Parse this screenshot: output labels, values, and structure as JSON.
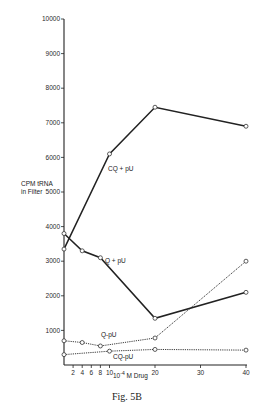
{
  "chart_data": {
    "type": "line",
    "title": "",
    "caption": "Fig. 5B",
    "xlabel": "10⁻⁴M Drug",
    "xlabel_base": "10",
    "xlabel_exp": "-4",
    "xlabel_unit": "M Drug",
    "ylabel": "CPM tRNA in Filter",
    "ylabel_line1": "CPM tRNA",
    "ylabel_line2": "in Filter",
    "xlim": [
      0,
      40
    ],
    "ylim": [
      0,
      10000
    ],
    "x_ticks": [
      2,
      4,
      6,
      8,
      10,
      20,
      30,
      40
    ],
    "y_ticks": [
      1000,
      2000,
      3000,
      4000,
      5000,
      6000,
      7000,
      8000,
      9000,
      10000
    ],
    "grid": false,
    "series": [
      {
        "name": "CQ + pU",
        "style": "solid",
        "x": [
          0,
          10,
          20,
          40
        ],
        "values": [
          3350,
          6100,
          7450,
          6900
        ]
      },
      {
        "name": "Q + pU",
        "style": "solid",
        "x": [
          0,
          4,
          8,
          20,
          40
        ],
        "values": [
          3800,
          3300,
          3100,
          1350,
          2100
        ]
      },
      {
        "name": "Q-pU",
        "style": "dotted",
        "x": [
          0,
          4,
          8,
          20,
          40
        ],
        "values": [
          700,
          650,
          550,
          780,
          3000
        ]
      },
      {
        "name": "CQ-pU",
        "style": "dotted",
        "x": [
          0,
          10,
          20,
          40
        ],
        "values": [
          300,
          400,
          450,
          430
        ]
      }
    ]
  }
}
